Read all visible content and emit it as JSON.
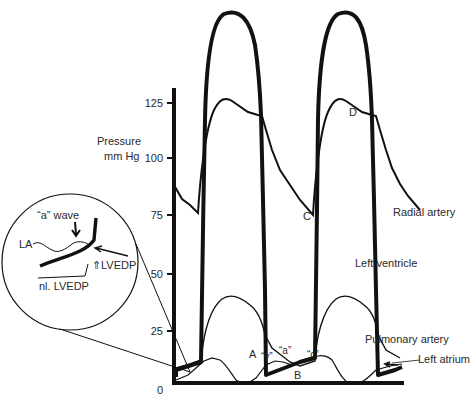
{
  "figure": {
    "y_axis": {
      "label_line1": "Pressure",
      "label_line2": "mm Hg",
      "ticks": [
        "0",
        "25",
        "50",
        "75",
        "100",
        "125"
      ]
    },
    "curve_labels": {
      "radial_artery": "Radial artery",
      "left_ventricle": "Left ventricle",
      "pulmonary_artery": "Pulmonary artery",
      "left_atrium": "Left atrium"
    },
    "point_labels": {
      "A": "A",
      "B": "B",
      "C": "C",
      "D": "D"
    },
    "wave_labels": {
      "v": "“v”",
      "a": "“a”",
      "c": "“c”"
    },
    "inset": {
      "a_wave": "“a” wave",
      "LA": "LA",
      "up_LVEDP": "⇑LVEDP",
      "nl_LVEDP": "nl. LVEDP"
    }
  }
}
